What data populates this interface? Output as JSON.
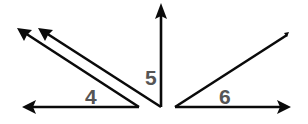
{
  "diagram": {
    "title": "",
    "angles": [
      {
        "id": "angle-4",
        "label": "4",
        "vertex": [
          139,
          107
        ],
        "rays": [
          "left-horizontal",
          "upper-left-diagonal-outer"
        ]
      },
      {
        "id": "angle-5",
        "label": "5",
        "vertex": [
          161,
          107
        ],
        "rays": [
          "upper-left-diagonal-inner",
          "vertical-up"
        ]
      },
      {
        "id": "angle-6",
        "label": "6",
        "vertex": [
          175,
          107
        ],
        "rays": [
          "right-horizontal",
          "upper-right-diagonal"
        ]
      }
    ],
    "colors": {
      "line": "#0a0a0a",
      "label": "#555555",
      "background": "#ffffff"
    }
  }
}
